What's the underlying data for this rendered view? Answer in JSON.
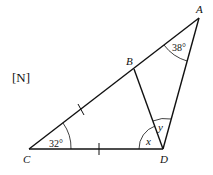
{
  "diagram": {
    "tag": "[N]",
    "points": {
      "A": {
        "label": "A",
        "x": 199,
        "y": 18
      },
      "B": {
        "label": "B",
        "x": 134,
        "y": 69
      },
      "C": {
        "label": "C",
        "x": 29,
        "y": 149
      },
      "D": {
        "label": "D",
        "x": 163,
        "y": 149
      }
    },
    "segments": [
      "CA",
      "CD",
      "DA",
      "BD"
    ],
    "angles": {
      "A": "38°",
      "C": "32°",
      "x": "x",
      "y": "y"
    },
    "tick_marks": [
      "CB",
      "CD"
    ],
    "colors": {
      "stroke": "#111111",
      "background": "#ffffff"
    }
  }
}
